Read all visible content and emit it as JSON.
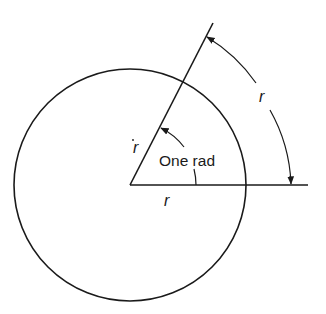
{
  "diagram": {
    "labels": {
      "radius_slanted": "r",
      "radius_horizontal": "r",
      "arc_length": "r",
      "angle": "One rad"
    },
    "colors": {
      "ink": "#1a1a1a",
      "background": "#ffffff"
    }
  }
}
